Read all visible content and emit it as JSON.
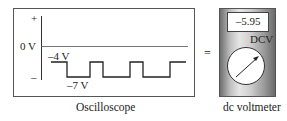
{
  "oscilloscope": {
    "plus_label": "+",
    "minus_label": "–",
    "zero_label": "0 V",
    "high_label": "–4 V",
    "low_label": "–7 V",
    "caption": "Oscilloscope"
  },
  "equals": "=",
  "voltmeter": {
    "reading": "–5.95",
    "mode_label": "DCV",
    "caption": "dc voltmeter",
    "body_color": "#bdbdbd"
  }
}
